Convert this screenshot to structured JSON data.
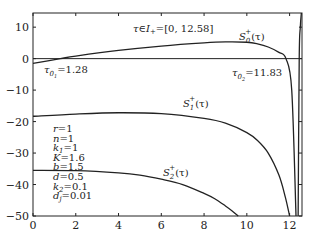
{
  "chart_data": {
    "type": "line",
    "title": "",
    "xlabel": "",
    "ylabel": "",
    "xlim": [
      0,
      12.58
    ],
    "ylim": [
      -50,
      14.5
    ],
    "grid": false,
    "x_ticks": [
      "0",
      "2",
      "4",
      "6",
      "8",
      "10",
      "12"
    ],
    "y_ticks": [
      "10",
      "0",
      "-10",
      "-20",
      "-30",
      "-40",
      "-50"
    ],
    "series": [
      {
        "name": "S0+(τ)",
        "x": [
          0,
          1.28,
          2,
          4,
          6,
          8,
          9,
          10,
          10.5,
          11,
          11.5,
          11.83,
          12.1,
          12.3
        ],
        "y": [
          -1.5,
          0,
          0.8,
          2.6,
          4.0,
          5.0,
          5.3,
          5.2,
          4.7,
          3.7,
          2.0,
          0,
          -10,
          -50
        ]
      },
      {
        "name": "S1+(τ)",
        "x": [
          0,
          2,
          4,
          6,
          8,
          9,
          10,
          10.5,
          11,
          11.5,
          11.8,
          12.0
        ],
        "y": [
          -18.3,
          -17.6,
          -17.2,
          -17.5,
          -19.0,
          -20.5,
          -23.5,
          -26.0,
          -30.0,
          -37.0,
          -44.0,
          -50
        ]
      },
      {
        "name": "S2+(τ)",
        "x": [
          0,
          2,
          4,
          5,
          6,
          7,
          8,
          8.5,
          9,
          9.3,
          9.6
        ],
        "y": [
          -35.5,
          -35.6,
          -36.3,
          -37.0,
          -38.3,
          -40.0,
          -42.8,
          -44.5,
          -46.8,
          -48.3,
          -50
        ]
      },
      {
        "name": "boundary",
        "x": [
          12.4,
          12.45,
          12.5,
          12.55
        ],
        "y": [
          -50,
          0,
          10,
          14.5
        ]
      }
    ],
    "hlines": [
      0
    ],
    "annotations": [
      {
        "text": "τ∈I+=[0, 12.58]",
        "x": 5.0,
        "y": 9
      },
      {
        "text": "τ01=1.28",
        "x": 0.2,
        "y": -3
      },
      {
        "text": "τ02=11.83",
        "x": 9.3,
        "y": -3
      },
      {
        "text": "S0+(τ)",
        "x": 9.2,
        "y": 7
      },
      {
        "text": "S1+(τ)",
        "x": 8.2,
        "y": -14
      },
      {
        "text": "S2+(τ)",
        "x": 6.3,
        "y": -32
      }
    ],
    "parameters": [
      "r=1",
      "n=1",
      "k1=1",
      "K=1.6",
      "b=1.5",
      "d=0.5",
      "k2=0.1",
      "dj=0.01"
    ]
  },
  "labels": {
    "interval": "τ∈I",
    "interval_sub": "+",
    "interval_val": "=[0, 12.58]",
    "tau01": "τ",
    "tau01_sub": "0",
    "tau01_subsub": "1",
    "tau01_val": "=1.28",
    "tau02": "τ",
    "tau02_sub": "0",
    "tau02_subsub": "2",
    "tau02_val": "=11.83",
    "s0": "S",
    "s0_sub": "0",
    "s0_sup": "+",
    "s0_arg": "(τ)",
    "s1": "S",
    "s1_sub": "1",
    "s1_sup": "+",
    "s1_arg": "(τ)",
    "s2": "S",
    "s2_sub": "2",
    "s2_sup": "+",
    "s2_arg": "(τ)"
  },
  "params": [
    {
      "name": "r",
      "sub": "",
      "val": "=1"
    },
    {
      "name": "n",
      "sub": "",
      "val": "=1"
    },
    {
      "name": "k",
      "sub": "1",
      "val": "=1"
    },
    {
      "name": "K",
      "sub": "",
      "val": "=1.6"
    },
    {
      "name": "b",
      "sub": "",
      "val": "=1.5"
    },
    {
      "name": "d",
      "sub": "",
      "val": "=0.5"
    },
    {
      "name": "k",
      "sub": "2",
      "val": "=0.1"
    },
    {
      "name": "d",
      "sub": "j",
      "val": "=0.01"
    }
  ]
}
